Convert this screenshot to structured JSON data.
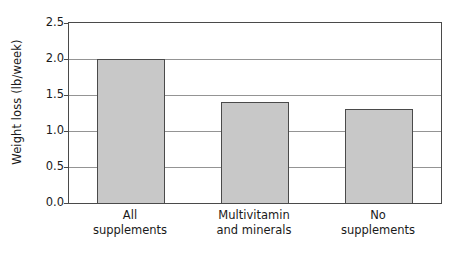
{
  "chart_data": {
    "type": "bar",
    "title": "",
    "subtitle": "",
    "xlabel": "",
    "ylabel": "Weight loss (lb/week)",
    "categories": [
      "All supplements",
      "Multivitamin and minerals",
      "No supplements"
    ],
    "category_lines": [
      [
        "All",
        "supplements"
      ],
      [
        "Multivitamin",
        "and minerals"
      ],
      [
        "No",
        "supplements"
      ]
    ],
    "values": [
      2.0,
      1.4,
      1.3
    ],
    "ylim": [
      0.0,
      2.5
    ],
    "yticks": [
      0.0,
      0.5,
      1.0,
      1.5,
      2.0,
      2.5
    ],
    "ytick_labels": [
      "0.0",
      "0.5",
      "1.0",
      "1.5",
      "2.0",
      "2.5"
    ],
    "grid": true,
    "grid_axis": "y",
    "legend": false,
    "legend_position": "none",
    "bar_fill_color": "#c8c8c8",
    "bar_border_color": "#4a4a4a",
    "gridline_color": "#949494",
    "frame_color": "#4a4a4a",
    "background_color": "#ffffff",
    "text_color": "#1a1a1a"
  }
}
